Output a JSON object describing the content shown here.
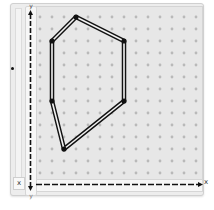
{
  "app": {
    "name": "Geoboard"
  },
  "axes": {
    "x_label": "x",
    "y_label": "y",
    "corner_label": "x",
    "bottom_y_label": "y"
  },
  "colors": {
    "board": "#e7e7e7",
    "peg": "#b9b9b9",
    "band_outer": "#111111",
    "band_inner": "#f2f2f2",
    "axis": "#111111"
  },
  "grid": {
    "columns": 14,
    "rows": 14,
    "origin_x": 40,
    "origin_y": 17,
    "spacing": 12
  },
  "polygon": {
    "name": "hexagon-rubber-band",
    "vertices_grid": [
      [
        3,
        0
      ],
      [
        7,
        2
      ],
      [
        7,
        7
      ],
      [
        2,
        11
      ],
      [
        1,
        7
      ],
      [
        1,
        2
      ]
    ]
  },
  "icons": {
    "y_arrow": "arrow-up-icon",
    "x_arrow": "arrow-right-icon",
    "side_handle": "drag-handle-icon"
  }
}
